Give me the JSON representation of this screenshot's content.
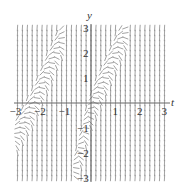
{
  "chart_data": {
    "type": "slope-field",
    "title": "",
    "xlabel": "t",
    "ylabel": "y",
    "xlim": [
      -3,
      3
    ],
    "ylim": [
      -3,
      3
    ],
    "x_ticks": [
      -3,
      -2,
      -1,
      1,
      2,
      3
    ],
    "y_ticks": [
      3,
      2,
      1,
      -1,
      -2,
      -3
    ],
    "grid": false,
    "legend": null,
    "flat_bands": [
      {
        "points": [
          [
            -3,
            -1.2
          ],
          [
            -2.4,
            -0.2
          ],
          [
            -1.8,
            1.2
          ],
          [
            -1.3,
            2.3
          ],
          [
            -1.0,
            3
          ]
        ]
      },
      {
        "points": [
          [
            -0.7,
            -3
          ],
          [
            -0.4,
            -1.8
          ],
          [
            -0.1,
            -0.6
          ],
          [
            0.2,
            0.2
          ],
          [
            0.7,
            1.3
          ],
          [
            1.2,
            2.4
          ],
          [
            1.5,
            3
          ]
        ]
      }
    ],
    "colors": {
      "segments": "#8a8a8a",
      "axes": "#666666",
      "labels": "#333333"
    }
  },
  "labels": {
    "t_axis": "t",
    "y_axis": "y",
    "x_tick_labels": [
      "−3",
      "−2",
      "−1",
      "1",
      "2",
      "3"
    ],
    "y_tick_labels": [
      "3",
      "2",
      "1",
      "−1",
      "−2",
      "−3"
    ]
  }
}
